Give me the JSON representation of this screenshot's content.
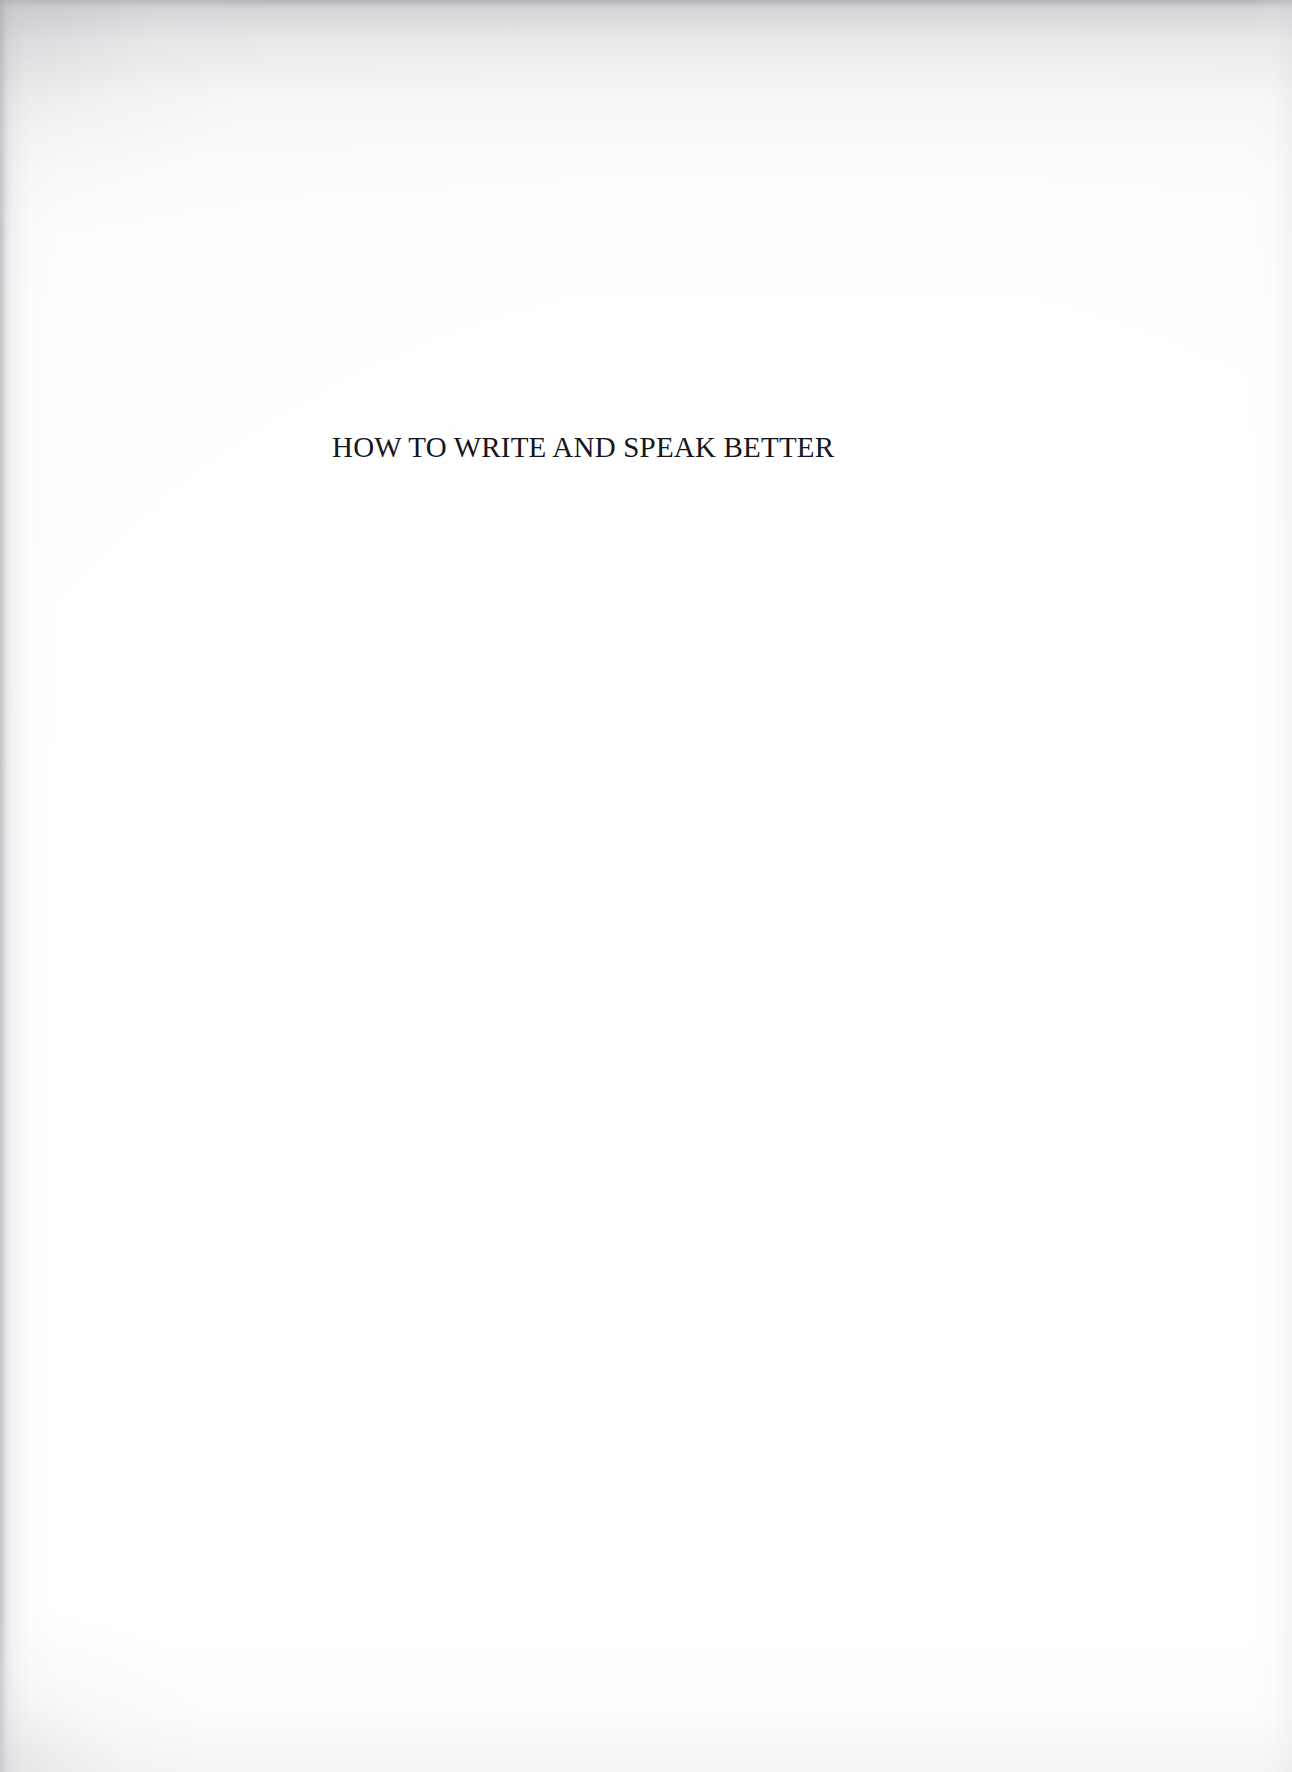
{
  "page": {
    "kind": "scanned-book-half-title-page",
    "width": 1292,
    "height": 1772,
    "background_color": "#fefefe",
    "text_color": "#16161c",
    "edge_shadow_color": "#a8aaae"
  },
  "title": {
    "text": "HOW TO WRITE AND SPEAK BETTER",
    "case": "uppercase",
    "alignment": "left-of-center",
    "font_style": "serif"
  },
  "body": {
    "content": "",
    "note": ""
  }
}
